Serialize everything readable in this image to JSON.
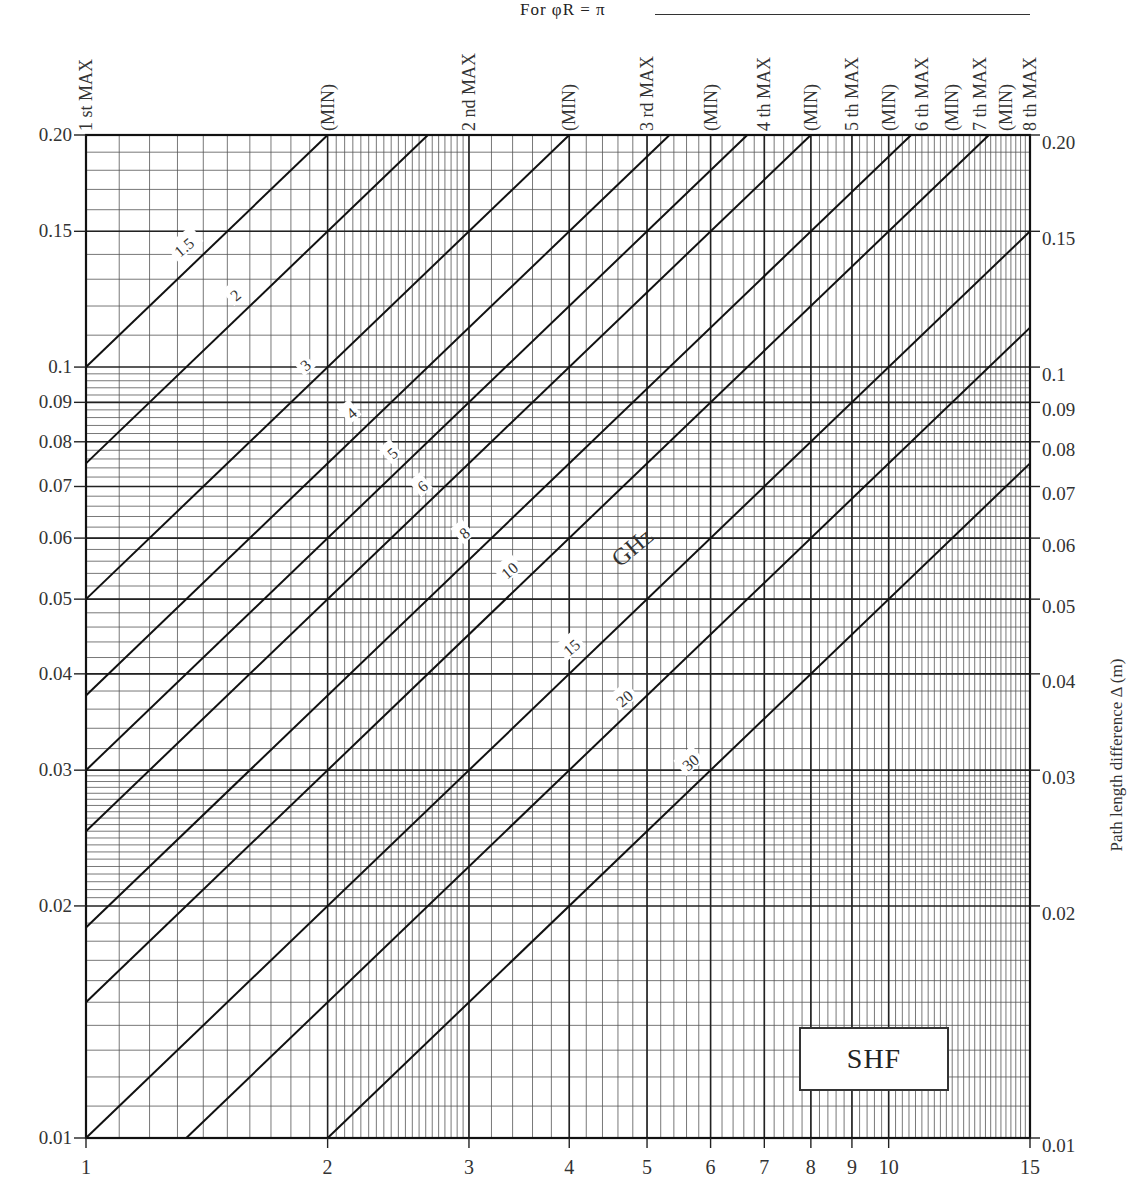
{
  "chart_data": {
    "type": "line",
    "title": "For φR = π",
    "xlabel": "",
    "ylabel": "Path length difference Δ (m)",
    "xscale": "log",
    "yscale": "log",
    "xlim": [
      1,
      15
    ],
    "ylim": [
      0.01,
      0.2
    ],
    "x_ticks": [
      1,
      2,
      3,
      4,
      5,
      6,
      7,
      8,
      9,
      10,
      15
    ],
    "y_ticks": [
      0.01,
      0.02,
      0.03,
      0.04,
      0.05,
      0.06,
      0.07,
      0.08,
      0.09,
      0.1,
      0.15,
      0.2
    ],
    "y_tick_labels_left": [
      "0.01",
      "0.02",
      "0.03",
      "0.04",
      "0.05",
      "0.06",
      "0.07",
      "0.08",
      "0.09",
      "0.1",
      "0.15",
      "0.20"
    ],
    "y_tick_labels_right": [
      "0.01",
      "0.02",
      "0.03",
      "0.04",
      "0.05",
      "0.06",
      "0.07",
      "0.08",
      "0.09",
      "0.1",
      "0.15",
      "0.20"
    ],
    "top_labels": [
      {
        "x": 1,
        "label": "1 st MAX"
      },
      {
        "x": 2,
        "label": "(MIN)"
      },
      {
        "x": 3,
        "label": "2 nd MAX"
      },
      {
        "x": 4,
        "label": "(MIN)"
      },
      {
        "x": 5,
        "label": "3 rd MAX"
      },
      {
        "x": 6,
        "label": "(MIN)"
      },
      {
        "x": 7,
        "label": "4 th MAX"
      },
      {
        "x": 8,
        "label": "(MIN)"
      },
      {
        "x": 9,
        "label": "5 th MAX"
      },
      {
        "x": 10,
        "label": "(MIN)"
      },
      {
        "x": 11,
        "label": "6 th MAX"
      },
      {
        "x": 12,
        "label": "(MIN)"
      },
      {
        "x": 13,
        "label": "7 th MAX"
      },
      {
        "x": 14,
        "label": "(MIN)"
      },
      {
        "x": 15,
        "label": "8 th MAX"
      }
    ],
    "series_unit": "GHz",
    "series_formula": "Δ = 0.15 · x / f",
    "series": [
      {
        "name": "1.5",
        "f": 1.5,
        "points": [
          [
            1,
            0.1
          ],
          [
            2,
            0.2
          ]
        ]
      },
      {
        "name": "2",
        "f": 2,
        "points": [
          [
            1,
            0.075
          ],
          [
            2,
            0.15
          ],
          [
            2.667,
            0.2
          ]
        ]
      },
      {
        "name": "3",
        "f": 3,
        "points": [
          [
            1,
            0.05
          ],
          [
            2,
            0.1
          ],
          [
            4,
            0.2
          ]
        ]
      },
      {
        "name": "4",
        "f": 4,
        "points": [
          [
            1,
            0.0375
          ],
          [
            2,
            0.075
          ],
          [
            4,
            0.15
          ],
          [
            5.333,
            0.2
          ]
        ]
      },
      {
        "name": "5",
        "f": 5,
        "points": [
          [
            1,
            0.03
          ],
          [
            2,
            0.06
          ],
          [
            5,
            0.15
          ],
          [
            6.667,
            0.2
          ]
        ]
      },
      {
        "name": "6",
        "f": 6,
        "points": [
          [
            1,
            0.025
          ],
          [
            2,
            0.05
          ],
          [
            6,
            0.15
          ],
          [
            8,
            0.2
          ]
        ]
      },
      {
        "name": "8",
        "f": 8,
        "points": [
          [
            1,
            0.01875
          ],
          [
            4,
            0.075
          ],
          [
            8,
            0.15
          ],
          [
            10.667,
            0.2
          ]
        ]
      },
      {
        "name": "10",
        "f": 10,
        "points": [
          [
            1,
            0.015
          ],
          [
            5,
            0.075
          ],
          [
            10,
            0.15
          ],
          [
            13.333,
            0.2
          ]
        ]
      },
      {
        "name": "15",
        "f": 15,
        "points": [
          [
            1,
            0.01
          ],
          [
            5,
            0.05
          ],
          [
            10,
            0.1
          ],
          [
            15,
            0.15
          ]
        ]
      },
      {
        "name": "20",
        "f": 20,
        "points": [
          [
            1.333,
            0.01
          ],
          [
            4,
            0.03
          ],
          [
            10,
            0.075
          ],
          [
            15,
            0.1125
          ]
        ]
      },
      {
        "name": "30",
        "f": 30,
        "points": [
          [
            2,
            0.01
          ],
          [
            6,
            0.03
          ],
          [
            10,
            0.05
          ],
          [
            15,
            0.075
          ]
        ]
      }
    ],
    "annotations": [
      "GHz",
      "SHF"
    ],
    "grid": true,
    "legend": "inline labels on lines"
  },
  "labels": {
    "title": "For  φR = π",
    "right_axis": "Path length difference  Δ (m)",
    "unit": "GHz",
    "band": "SHF"
  }
}
